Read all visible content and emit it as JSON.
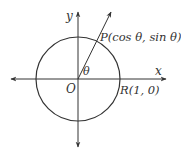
{
  "figure": {
    "labels": {
      "y_axis": "y",
      "x_axis": "x",
      "origin": "O",
      "angle": "θ",
      "point_p": "P(cos θ, sin θ)",
      "point_r": "R(1, 0)"
    },
    "colors": {
      "stroke": "#333333",
      "background": "#ffffff"
    },
    "geometry": {
      "origin_px": [
        78,
        79
      ],
      "radius_px": 42,
      "ray_angle_deg": 64
    }
  }
}
